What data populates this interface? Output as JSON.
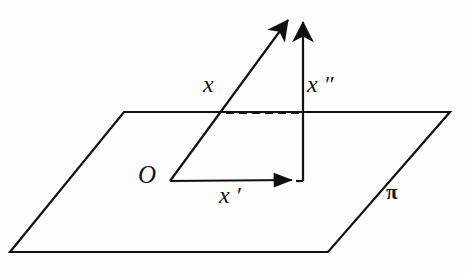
{
  "figure": {
    "background_color": "#fdfdfd",
    "stroke_color": "#111111",
    "labels": {
      "origin": "O",
      "vector_x": "x",
      "vector_x_prime": "x ′",
      "vector_x_double_prime": "x ″",
      "plane": "π"
    },
    "geometry": {
      "plane": {
        "name": "pi",
        "shape": "parallelogram",
        "points": "124,112 450,112 328,252 10,252"
      },
      "origin_point": {
        "x": 170,
        "y": 181
      },
      "vector_x": {
        "from": {
          "x": 170,
          "y": 181
        },
        "to": {
          "x": 290,
          "y": 18
        },
        "style": "solid",
        "arrow": "end"
      },
      "vector_x_prime": {
        "from": {
          "x": 170,
          "y": 181
        },
        "to": {
          "x": 297,
          "y": 180
        },
        "style": "solid",
        "arrow": "end"
      },
      "vector_x_double_prime": {
        "from": {
          "x": 303,
          "y": 181
        },
        "to": {
          "x": 303,
          "y": 18
        },
        "style": "solid",
        "arrow": "end"
      },
      "projection_dashed": {
        "from": {
          "x": 226,
          "y": 113
        },
        "to": {
          "x": 300,
          "y": 113
        },
        "style": "dashed"
      }
    }
  }
}
